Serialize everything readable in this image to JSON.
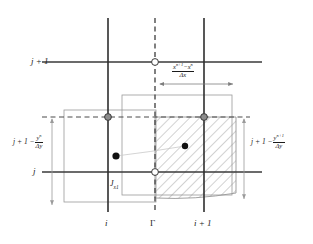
{
  "figure": {
    "background_color": "#ffffff",
    "line_color": "#1b1b1b",
    "box_color": "#9a9a9a",
    "hatch_color": "#7d7d7d",
    "marker_gray": "#8c8c8c"
  },
  "labels": {
    "y_top": "j + 1",
    "y_bottom": "j",
    "y_left_mid_prefix": "j + 1 −",
    "y_left_mid_num": "y",
    "y_left_mid_num_sup": "n",
    "y_left_mid_den": "Δy",
    "y_right_mid_prefix": "j + 1 −",
    "y_right_mid_num": "y",
    "y_right_mid_num_sup": "n+1",
    "y_right_mid_den": "Δy",
    "x_left": "i",
    "x_mid": "Γ",
    "x_right": "i + 1",
    "flux_label": "J",
    "flux_label_sub": "x1",
    "dx_num_a": "x",
    "dx_num_a_sup": "n+1",
    "dx_num_minus": "−",
    "dx_num_b": "x",
    "dx_num_b_sup": "n",
    "dx_den": "Δx"
  },
  "geometry": {
    "vertical_lines": [
      {
        "name": "i",
        "x": 108,
        "y1": 18,
        "y2": 212,
        "style": "solid"
      },
      {
        "name": "gamma",
        "x": 155,
        "y1": 18,
        "y2": 212,
        "style": "dashed"
      },
      {
        "name": "i+1",
        "x": 204,
        "y1": 18,
        "y2": 212,
        "style": "solid"
      }
    ],
    "horizontal_lines": [
      {
        "name": "j+1",
        "y": 62,
        "x1": 42,
        "x2": 262,
        "style": "solid"
      },
      {
        "name": "interface-mid",
        "y": 117,
        "x1": 42,
        "x2": 250,
        "style": "dashed"
      },
      {
        "name": "j",
        "y": 172,
        "x1": 42,
        "x2": 262,
        "style": "solid"
      }
    ],
    "open_circles": [
      {
        "cx": 155,
        "cy": 62
      },
      {
        "cx": 155,
        "cy": 172
      }
    ],
    "gray_circles": [
      {
        "cx": 108,
        "cy": 117
      },
      {
        "cx": 204,
        "cy": 117
      }
    ],
    "black_dots": [
      {
        "cx": 116,
        "cy": 156
      },
      {
        "cx": 185,
        "cy": 146
      }
    ],
    "boxes": [
      {
        "name": "left-box",
        "x": 64,
        "y": 110,
        "w": 92,
        "h": 92
      },
      {
        "name": "mid-box",
        "x": 122,
        "y": 95,
        "w": 110,
        "h": 100
      }
    ],
    "hatched_region": {
      "name": "swept-flux-region",
      "top_left_x": 155,
      "top_y": 117,
      "top_right_x": 236,
      "bottom_left_x": 155,
      "bottom_left_y": 198,
      "bottom_right_x": 236,
      "bottom_right_y": 193
    },
    "arrows": {
      "horizontal_dx": {
        "x1": 160,
        "x2": 233,
        "y": 84
      },
      "vertical_left": {
        "x": 52,
        "y1": 119,
        "y2": 205
      },
      "vertical_right": {
        "x": 244,
        "y1": 119,
        "y2": 199
      }
    }
  }
}
